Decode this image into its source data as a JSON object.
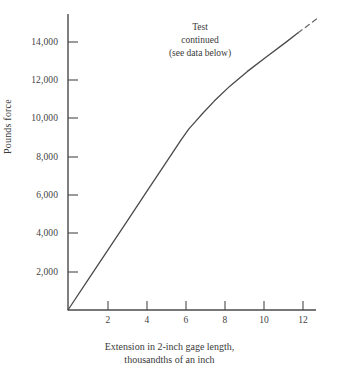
{
  "chart_data": {
    "type": "line",
    "title": "",
    "xlabel": "Extension in 2-inch gage length, thousandths of an inch",
    "ylabel": "Pounds force",
    "xlim": [
      0,
      12.7
    ],
    "ylim": [
      0,
      15100
    ],
    "grid": false,
    "legend": false,
    "xticks": [
      2,
      4,
      6,
      8,
      10,
      12
    ],
    "xtick_labels": [
      "2",
      "4",
      "6",
      "8",
      "10",
      "12"
    ],
    "yticks": [
      2000,
      4000,
      6000,
      8000,
      10000,
      12000,
      14000
    ],
    "ytick_labels": [
      "2,000",
      "4,000",
      "6,000",
      "8,000",
      "10,000",
      "12,000",
      "14,000"
    ],
    "series": [
      {
        "name": "load-extension curve (solid)",
        "style": "solid",
        "color": "#4a4a4a",
        "x": [
          0,
          1,
          2,
          3,
          4,
          5,
          5.8,
          6.2,
          6.5,
          6.9,
          7.5,
          8.3,
          9.2,
          10.2,
          11.2,
          11.8
        ],
        "y": [
          0,
          1530,
          3060,
          4590,
          6120,
          7650,
          8880,
          9450,
          9790,
          10250,
          10900,
          11680,
          12450,
          13230,
          13990,
          14460
        ]
      },
      {
        "name": "extrapolated continuation (dashed)",
        "style": "dashed",
        "color": "#6a6a6a",
        "x": [
          11.8,
          12.35,
          12.9
        ],
        "y": [
          14460,
          14880,
          15300
        ]
      }
    ],
    "annotations": [
      {
        "name": "test-continued-note",
        "lines": [
          "Test",
          "continued",
          "(see data below)"
        ],
        "x": 6.2,
        "y": 14250
      }
    ],
    "axis_lines": {
      "color": "#4a4a4a",
      "x_axis_from": 0,
      "x_axis_to": 12.7,
      "y_axis_from": 0,
      "y_axis_to": 15100,
      "tick_direction": "inward"
    }
  },
  "xlabel_lines": {
    "line1": "Extension in 2-inch gage length,",
    "line2": "thousandths of an inch"
  },
  "annotation_lines": {
    "line1": "Test",
    "line2": "continued",
    "line3": "(see data below)"
  },
  "ylabel_text": "Pounds force"
}
